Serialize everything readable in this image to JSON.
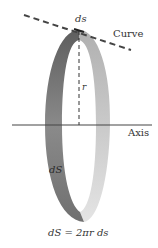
{
  "labels": {
    "ds": "ds",
    "curve": "Curve",
    "r": "r",
    "axis": "Axis",
    "dS": "dS",
    "formula": "dS = 2πr ds"
  },
  "colors": {
    "band_dark": "#6e6e6e",
    "band_light": "#c8c8c8",
    "line": "#444444",
    "text": "#333333"
  }
}
